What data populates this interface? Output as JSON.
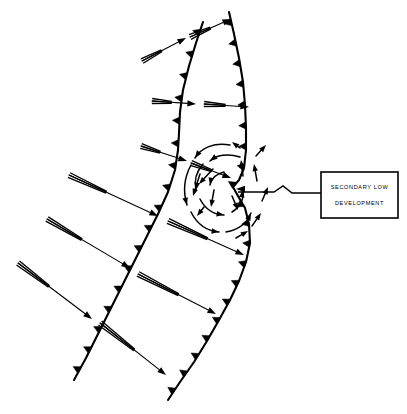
{
  "figure": {
    "kind": "synoptic-weather-front-diagram",
    "background_color": "#ffffff",
    "ink_color": "#000000",
    "width": 407,
    "height": 414
  },
  "callout": {
    "line1": "SECONDARY LOW",
    "line2": "DEVELOPMENT",
    "box": {
      "x": 321,
      "y": 172,
      "width": 77,
      "height": 46
    },
    "pointer_target": {
      "x": 236,
      "y": 189
    },
    "pointer_path": "M 321 193 L 292 193 L 283 186 L 274 192 L 238 192"
  },
  "fronts": [
    {
      "name": "leading-cold-front",
      "type": "cold-front",
      "barb_side": "right",
      "barb_count": 17,
      "path": "M 203 22 L 196 43 L 189 66 L 183 90 L 180 112 L 179 133 L 178 150 L 175 170 L 168 192 L 158 214 L 146 238 L 134 262 L 122 286 L 110 310 L 98 334 L 86 358 L 74 380"
    },
    {
      "name": "trailing-cold-front",
      "type": "cold-front",
      "barb_side": "right",
      "barb_count": 20,
      "path": "M 229 12 L 234 34 L 239 58 L 243 82 L 245 105 L 246 128 L 246 150 L 244 168 L 239 180 L 233 187 L 238 196 L 245 208 L 249 224 L 250 243 L 246 262 L 239 281 L 230 300 L 219 320 L 207 341 L 194 362 L 180 382 L 168 400"
    }
  ],
  "wind_arrows": [
    {
      "name": "wind-arrow-1",
      "tail_start": [
        142,
        61
      ],
      "tip": [
        186,
        38
      ],
      "tail_frac": 0.45
    },
    {
      "name": "wind-arrow-2",
      "tail_start": [
        190,
        37
      ],
      "tip": [
        231,
        19
      ],
      "tail_frac": 0.5
    },
    {
      "name": "wind-arrow-3",
      "tail_start": [
        152,
        101
      ],
      "tip": [
        196,
        104
      ],
      "tail_frac": 0.45
    },
    {
      "name": "wind-arrow-4",
      "tail_start": [
        204,
        104
      ],
      "tip": [
        249,
        107
      ],
      "tail_frac": 0.48
    },
    {
      "name": "wind-arrow-5",
      "tail_start": [
        141,
        146
      ],
      "tip": [
        187,
        161
      ],
      "tail_frac": 0.42
    },
    {
      "name": "wind-arrow-6",
      "tail_start": [
        191,
        163
      ],
      "tip": [
        231,
        178
      ],
      "tail_frac": 0.52
    },
    {
      "name": "wind-arrow-7",
      "tail_start": [
        69,
        175
      ],
      "tip": [
        158,
        216
      ],
      "tail_frac": 0.42
    },
    {
      "name": "wind-arrow-8",
      "tail_start": [
        168,
        221
      ],
      "tip": [
        244,
        255
      ],
      "tail_frac": 0.52
    },
    {
      "name": "wind-arrow-9",
      "tail_start": [
        47,
        219
      ],
      "tip": [
        130,
        268
      ],
      "tail_frac": 0.42
    },
    {
      "name": "wind-arrow-10",
      "tail_start": [
        138,
        274
      ],
      "tip": [
        216,
        314
      ],
      "tail_frac": 0.52
    },
    {
      "name": "wind-arrow-11",
      "tail_start": [
        18,
        263
      ],
      "tip": [
        92,
        319
      ],
      "tail_frac": 0.42
    },
    {
      "name": "wind-arrow-12",
      "tail_start": [
        100,
        323
      ],
      "tip": [
        166,
        375
      ],
      "tail_frac": 0.52
    }
  ],
  "circulation": {
    "name": "secondary-low-cyclonic-circulation",
    "rotation": "counterclockwise",
    "center": [
      222,
      193
    ],
    "inner_arcs": [
      {
        "name": "circ-arc-inner-top",
        "path": "M 240 157 C 228 153, 216 155, 210 161",
        "tip": [
          210,
          161
        ],
        "angle": 142
      },
      {
        "name": "circ-arc-inner-left",
        "path": "M 203 164 C 196 172, 194 181, 196 190",
        "tip": [
          196,
          190
        ],
        "angle": 100
      },
      {
        "name": "circ-arc-inner-bottom",
        "path": "M 200 199 C 205 209, 214 215, 224 215",
        "tip": [
          224,
          215
        ],
        "angle": 10
      },
      {
        "name": "circ-arc-inner-right",
        "path": "M 232 212 C 240 207, 244 199, 243 190",
        "tip": [
          243,
          190
        ],
        "angle": -80
      },
      {
        "name": "circ-arc-inner-upper-left",
        "path": "M 224 172 C 216 174, 211 179, 210 185",
        "tip": [
          210,
          185
        ],
        "angle": 100
      }
    ],
    "outer_arcs": [
      {
        "name": "circ-arc-outer-topleft",
        "path": "M 230 145 C 214 142, 201 148, 195 158",
        "tip": [
          195,
          158
        ],
        "angle": 125
      },
      {
        "name": "circ-arc-outer-left",
        "path": "M 191 165 C 184 178, 183 192, 187 205",
        "tip": [
          187,
          205
        ],
        "angle": 75
      },
      {
        "name": "circ-arc-outer-bottomleft",
        "path": "M 191 212 C 197 224, 207 231, 219 232",
        "tip": [
          219,
          232
        ],
        "angle": 8
      },
      {
        "name": "circ-arc-outer-bottom",
        "path": "M 226 232 C 238 230, 247 223, 251 213",
        "tip": [
          251,
          213
        ],
        "angle": -65
      }
    ],
    "radial_arrows": [
      {
        "name": "circ-radial-1",
        "from": [
          213,
          169
        ],
        "to": [
          199,
          184
        ]
      },
      {
        "name": "circ-radial-2",
        "from": [
          200,
          174
        ],
        "to": [
          193,
          196
        ]
      },
      {
        "name": "circ-radial-3",
        "from": [
          214,
          190
        ],
        "to": [
          211,
          207
        ]
      },
      {
        "name": "circ-radial-4",
        "from": [
          232,
          196
        ],
        "to": [
          238,
          210
        ]
      },
      {
        "name": "circ-radial-5",
        "from": [
          243,
          176
        ],
        "to": [
          241,
          160
        ]
      },
      {
        "name": "circ-radial-6",
        "from": [
          257,
          181
        ],
        "to": [
          254,
          164
        ]
      },
      {
        "name": "circ-radial-7",
        "from": [
          262,
          201
        ],
        "to": [
          268,
          187
        ]
      },
      {
        "name": "circ-radial-8",
        "from": [
          252,
          226
        ],
        "to": [
          261,
          213
        ]
      },
      {
        "name": "circ-radial-9",
        "from": [
          236,
          238
        ],
        "to": [
          248,
          231
        ]
      },
      {
        "name": "circ-radial-10",
        "from": [
          256,
          156
        ],
        "to": [
          266,
          145
        ]
      },
      {
        "name": "circ-radial-11",
        "from": [
          240,
          148
        ],
        "to": [
          232,
          142
        ]
      },
      {
        "name": "circ-radial-12",
        "from": [
          204,
          207
        ],
        "to": [
          197,
          216
        ]
      }
    ]
  }
}
